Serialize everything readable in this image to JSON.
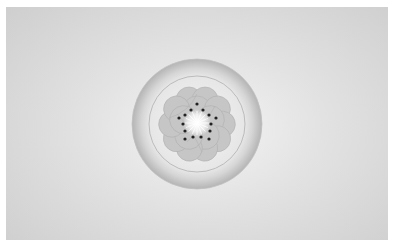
{
  "caption": {
    "text": "",
    "note": "cut off at top edge, illegible"
  },
  "image": {
    "subject": "flower emblem in a round dish",
    "description": "Grayscale rendering of a five-petal plum blossom with dotted stamens and a radiant white center, inside a light circular plate with a thin inner ring and a shaded outer rim, on a soft gray vignette background",
    "colors": {
      "background_outer": "#cfcfcf",
      "background_center": "#f4f4f4",
      "rim_dark": "#b8b8b8",
      "rim_light": "#e8e8e8",
      "plate": "#efefef",
      "petal": "#c4c4c4",
      "petal_outline": "#aaaaaa",
      "stamen_dot": "#222222",
      "center_glow": "#ffffff"
    },
    "stamen_count": 15,
    "petal_count": 5
  }
}
